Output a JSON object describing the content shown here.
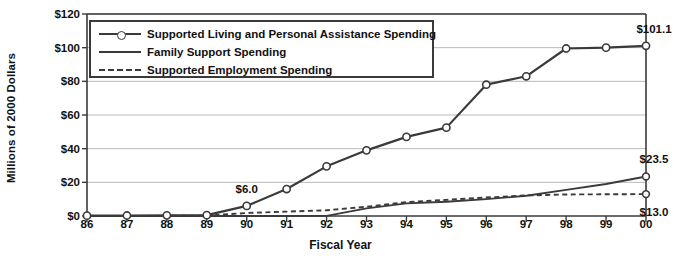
{
  "chart_data": {
    "type": "line",
    "title": "",
    "xlabel": "Fiscal Year",
    "ylabel": "Millions of 2000 Dollars",
    "categories": [
      "86",
      "87",
      "88",
      "89",
      "90",
      "91",
      "92",
      "93",
      "94",
      "95",
      "96",
      "97",
      "98",
      "99",
      "00"
    ],
    "x": [
      1986,
      1987,
      1988,
      1989,
      1990,
      1991,
      1992,
      1993,
      1994,
      1995,
      1996,
      1997,
      1998,
      1999,
      2000
    ],
    "ylim": [
      0,
      120
    ],
    "yticks": [
      0,
      20,
      40,
      60,
      80,
      100,
      120
    ],
    "ytick_labels": [
      "$0",
      "$20",
      "$40",
      "$60",
      "$80",
      "$100",
      "$120"
    ],
    "grid": "horizontal",
    "legend_position": "top-left-inside",
    "series": [
      {
        "name": "Supported Living and Personal Assistance Spending",
        "style": "solid-with-circle-markers",
        "color": "#3a3a3a",
        "values": [
          0.2,
          0.3,
          0.4,
          0.5,
          6.0,
          16.0,
          29.5,
          39.0,
          47.0,
          52.5,
          78.0,
          83.0,
          99.5,
          100.0,
          101.1
        ]
      },
      {
        "name": "Family Support Spending",
        "style": "solid",
        "color": "#3a3a3a",
        "values": [
          0.0,
          0.0,
          0.0,
          0.0,
          0.0,
          0.0,
          0.1,
          4.5,
          7.5,
          8.5,
          10.0,
          12.0,
          15.5,
          19.0,
          23.5
        ]
      },
      {
        "name": "Supported Employment Spending",
        "style": "dashed",
        "color": "#3a3a3a",
        "values": [
          0.0,
          0.0,
          0.1,
          0.2,
          1.8,
          2.6,
          3.4,
          5.5,
          8.2,
          9.6,
          11.0,
          12.2,
          12.8,
          12.9,
          13.0
        ]
      }
    ],
    "annotations": [
      {
        "text": "$6.0",
        "x_category": "90",
        "value": 6.0,
        "placement": "above-point"
      },
      {
        "text": "$101.1",
        "x_category": "00",
        "value": 101.1,
        "placement": "above-right-end"
      },
      {
        "text": "$23.5",
        "x_category": "00",
        "value": 23.5,
        "placement": "above-right-end"
      },
      {
        "text": "$13.0",
        "x_category": "00",
        "value": 13.0,
        "placement": "below-right-end"
      }
    ],
    "colors": {
      "line": "#3a3a3a",
      "grid": "#b9b9b9",
      "axis": "#3a3a3a",
      "text": "#111111",
      "marker_fill": "#ffffff",
      "background": "#ffffff"
    }
  }
}
